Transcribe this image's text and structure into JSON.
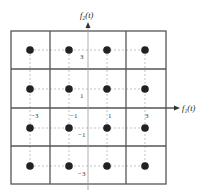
{
  "diagram": {
    "x_axis": {
      "label": "f₁(t)"
    },
    "y_axis": {
      "label": "f₂(t)"
    },
    "x_ticks": [
      "−3",
      "−1",
      "1",
      "3"
    ],
    "y_ticks": [
      "3",
      "1",
      "−1",
      "−3"
    ],
    "points": [
      {
        "x": -3,
        "y": 3
      },
      {
        "x": -1,
        "y": 3
      },
      {
        "x": 1,
        "y": 3
      },
      {
        "x": 3,
        "y": 3
      },
      {
        "x": -3,
        "y": 1
      },
      {
        "x": -1,
        "y": 1
      },
      {
        "x": 1,
        "y": 1
      },
      {
        "x": 3,
        "y": 1
      },
      {
        "x": -3,
        "y": -1
      },
      {
        "x": -1,
        "y": -1
      },
      {
        "x": 1,
        "y": -1
      },
      {
        "x": 3,
        "y": -1
      },
      {
        "x": -3,
        "y": -3
      },
      {
        "x": -1,
        "y": -3
      },
      {
        "x": 1,
        "y": -3
      },
      {
        "x": 3,
        "y": -3
      }
    ],
    "colors": {
      "grid": "#555555",
      "point": "#222222",
      "dotted": "#999999"
    }
  }
}
